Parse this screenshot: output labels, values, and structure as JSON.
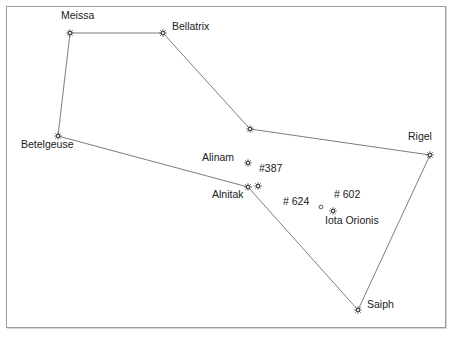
{
  "chart_data": {
    "type": "scatter",
    "title": "",
    "xlabel": "",
    "ylabel": "",
    "xlim": [
      0,
      457
    ],
    "ylim": [
      0,
      338
    ],
    "grid": false,
    "legend": "none",
    "marker_style": "asterisk-sunburst",
    "stars": [
      {
        "id": "meissa",
        "label": "Meissa",
        "x": 70,
        "y": 33,
        "marker": "asterisk",
        "label_dx": -9,
        "label_dy": -17
      },
      {
        "id": "bellatrix",
        "label": "Bellatrix",
        "x": 163,
        "y": 33,
        "marker": "asterisk",
        "label_dx": 9,
        "label_dy": -6
      },
      {
        "id": "vertex-upper",
        "label": "",
        "x": 250,
        "y": 129,
        "marker": "asterisk",
        "label_dx": 0,
        "label_dy": 0
      },
      {
        "id": "betelgeuse",
        "label": "Betelgeuse",
        "x": 58,
        "y": 136,
        "marker": "asterisk",
        "label_dx": -37,
        "label_dy": 9
      },
      {
        "id": "rigel",
        "label": "Rigel",
        "x": 430,
        "y": 155,
        "marker": "asterisk",
        "label_dx": -22,
        "label_dy": -18
      },
      {
        "id": "alinam",
        "label": "Alinam",
        "x": 248,
        "y": 163,
        "marker": "asterisk",
        "label_dx": -46,
        "label_dy": -5
      },
      {
        "id": "star-387",
        "label": "#387",
        "x": 258,
        "y": 186,
        "marker": "asterisk",
        "label_dx": 1,
        "label_dy": -17
      },
      {
        "id": "alnitak",
        "label": "Alnitak",
        "x": 248,
        "y": 187,
        "marker": "asterisk",
        "label_dx": -36,
        "label_dy": 8
      },
      {
        "id": "star-624",
        "label": "# 624",
        "x": 321,
        "y": 207,
        "marker": "circle",
        "label_dx": -38,
        "label_dy": -5
      },
      {
        "id": "star-602",
        "label": "# 602",
        "x": 333,
        "y": 211,
        "marker": "asterisk",
        "label_dx": 1,
        "label_dy": -16
      },
      {
        "id": "iota-orionis",
        "label": "Iota Orionis",
        "x": 333,
        "y": 211,
        "marker": "none",
        "label_dx": -8,
        "label_dy": 10
      },
      {
        "id": "saiph",
        "label": "Saiph",
        "x": 358,
        "y": 310,
        "marker": "asterisk",
        "label_dx": 9,
        "label_dy": -5
      }
    ],
    "lines": [
      {
        "from": "meissa",
        "to": "bellatrix"
      },
      {
        "from": "meissa",
        "to": "betelgeuse"
      },
      {
        "from": "bellatrix",
        "to": "vertex-upper"
      },
      {
        "from": "vertex-upper",
        "to": "rigel"
      },
      {
        "from": "betelgeuse",
        "to": "alnitak"
      },
      {
        "from": "alnitak",
        "to": "saiph"
      },
      {
        "from": "saiph",
        "to": "rigel"
      }
    ],
    "colors": {
      "background": "#ffffff",
      "line": "#6e6e6e",
      "star": "#3a3a3a",
      "label": "#1a1a1a",
      "frame": "#9a9a9a"
    }
  }
}
